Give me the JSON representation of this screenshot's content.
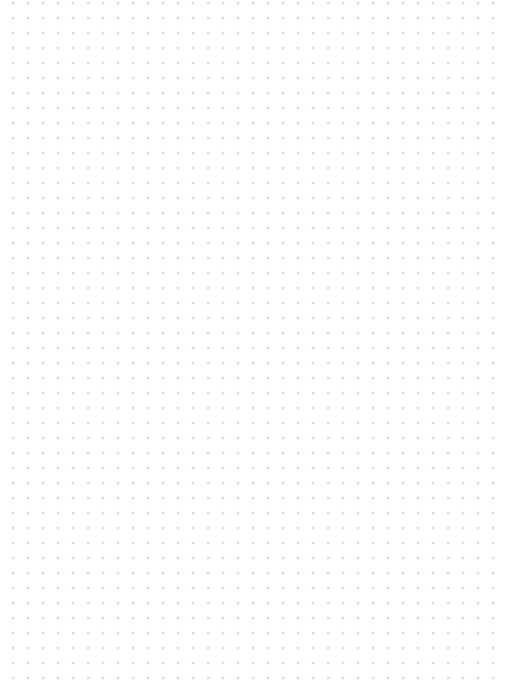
{
  "page": {
    "kind": "dot-grid-paper",
    "title": "",
    "width": 523,
    "height": 696,
    "background_color": "#ffffff",
    "content_text": "",
    "has_visible_text": false,
    "has_visible_controls": false
  },
  "grid": {
    "dot_color": "#9e9eab",
    "dot_halo_color": "#d8d8e2",
    "dot_diameter_px": 1.2,
    "spacing_x_px": 15,
    "spacing_y_px": 15,
    "origin_x_px": 13,
    "origin_y_px": 33,
    "columns": 33,
    "rows": 44,
    "margin_top_px": 32,
    "margin_left_px": 13,
    "margin_right_px": 25,
    "margin_bottom_px": 17
  }
}
